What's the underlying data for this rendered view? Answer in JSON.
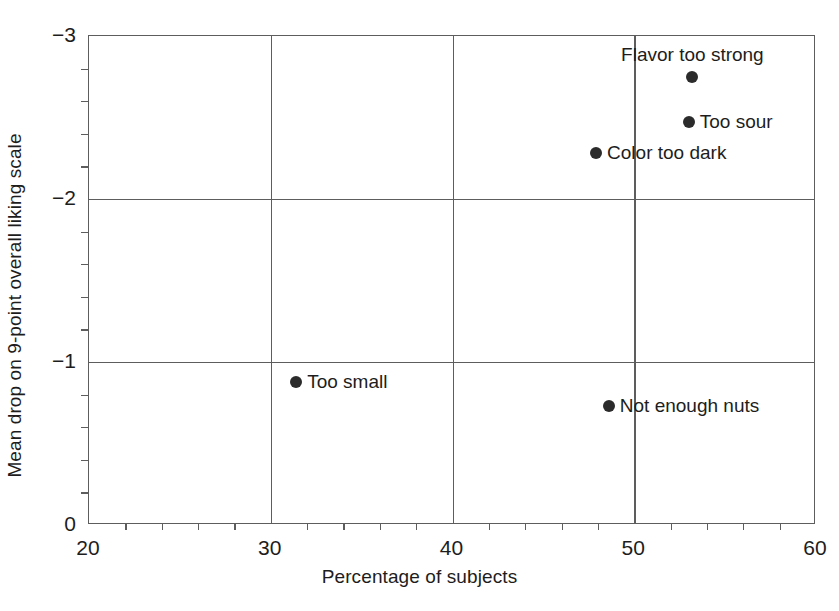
{
  "chart_data": {
    "type": "scatter",
    "title": "",
    "xlabel": "Percentage of subjects",
    "ylabel": "Mean drop on 9-point overall liking scale",
    "xlim": [
      20,
      60
    ],
    "ylim": [
      0,
      -3
    ],
    "y_inverted": true,
    "grid": true,
    "legend": "none",
    "x_ticks": [
      20,
      30,
      40,
      50,
      60
    ],
    "x_tick_labels": [
      "20",
      "30",
      "40",
      "50",
      "60"
    ],
    "x_minor_step": 2,
    "y_ticks": [
      -3,
      -2,
      -1,
      0
    ],
    "y_tick_labels": [
      "−3",
      "−2",
      "−1",
      "0"
    ],
    "y_minor_step": 0.2,
    "gridlines_x": [
      30,
      40,
      50
    ],
    "gridlines_y": [
      -2,
      -1
    ],
    "marker_color": "#2b2b2b",
    "marker_size_px": 12,
    "points": [
      {
        "label": "Flavor too strong",
        "x": 53.2,
        "y": -2.75,
        "label_pos": "above"
      },
      {
        "label": "Too sour",
        "x": 53.0,
        "y": -2.47,
        "label_pos": "right"
      },
      {
        "label": "Color too dark",
        "x": 47.9,
        "y": -2.28,
        "label_pos": "right"
      },
      {
        "label": "Too small",
        "x": 31.4,
        "y": -0.88,
        "label_pos": "right"
      },
      {
        "label": "Not enough nuts",
        "x": 48.6,
        "y": -0.73,
        "label_pos": "right"
      }
    ]
  }
}
